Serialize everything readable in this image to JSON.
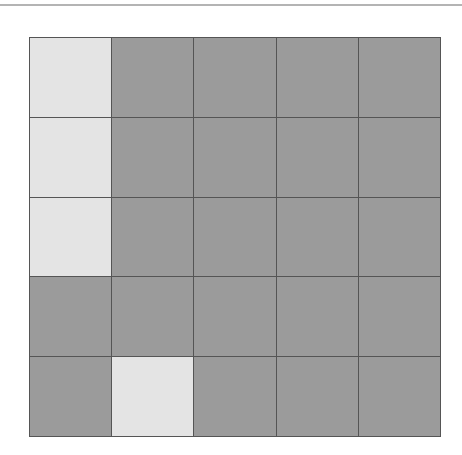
{
  "board": {
    "rows": 5,
    "cols": 5,
    "colors": {
      "lit": "#e4e4e4",
      "unlit": "#9b9b9b",
      "grid_line": "#555555"
    },
    "cells": [
      [
        1,
        0,
        0,
        0,
        0
      ],
      [
        1,
        0,
        0,
        0,
        0
      ],
      [
        1,
        0,
        0,
        0,
        0
      ],
      [
        0,
        0,
        0,
        0,
        0
      ],
      [
        0,
        1,
        0,
        0,
        0
      ]
    ]
  }
}
